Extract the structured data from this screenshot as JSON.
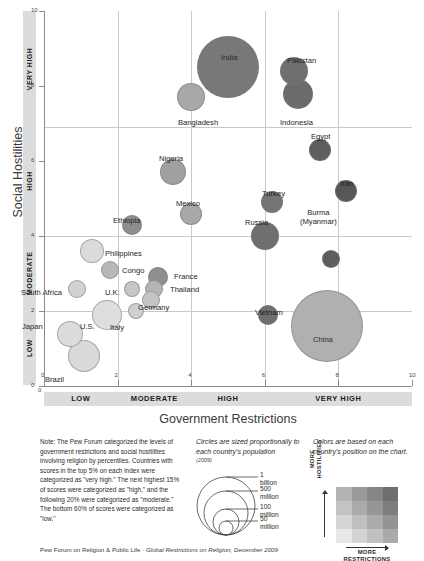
{
  "chart_data": {
    "type": "scatter",
    "title": "",
    "xlabel": "Government Restrictions",
    "ylabel": "Social Hostilities",
    "xlim": [
      0,
      10
    ],
    "ylim": [
      0,
      10
    ],
    "grid": true,
    "x_ticks": [
      "0",
      "2",
      "4",
      "6",
      "8",
      "10"
    ],
    "y_ticks": [
      "0",
      "2",
      "4",
      "6",
      "8",
      "10"
    ],
    "x_zones": [
      "LOW",
      "MODERATE",
      "HIGH",
      "VERY HIGH"
    ],
    "y_zones": [
      "LOW",
      "MODERATE",
      "HIGH",
      "VERY HIGH"
    ],
    "size_encoding": "population",
    "points": [
      {
        "label": "India",
        "x": 5.0,
        "y": 8.5,
        "r": 31,
        "color": "#787878",
        "lx": 221,
        "ly": 53,
        "inside": true
      },
      {
        "label": "Pakistan",
        "x": 6.8,
        "y": 8.4,
        "r": 14,
        "color": "#6f6f6f",
        "lx": 287,
        "ly": 56,
        "inside": false
      },
      {
        "label": "Indonesia",
        "x": 6.9,
        "y": 7.8,
        "r": 15,
        "color": "#6b6b6b",
        "lx": 280,
        "ly": 118,
        "inside": false
      },
      {
        "label": "Bangladesh",
        "x": 4.0,
        "y": 7.7,
        "r": 14,
        "color": "#a8a8a8",
        "lx": 178,
        "ly": 118,
        "inside": false
      },
      {
        "label": "Egypt",
        "x": 7.5,
        "y": 6.3,
        "r": 11,
        "color": "#5d5d5d",
        "lx": 311,
        "ly": 132,
        "inside": false
      },
      {
        "label": "Nigeria",
        "x": 3.5,
        "y": 5.7,
        "r": 13,
        "color": "#a0a0a0",
        "lx": 159,
        "ly": 154,
        "inside": false
      },
      {
        "label": "Iran",
        "x": 8.2,
        "y": 5.2,
        "r": 11,
        "color": "#575757",
        "lx": 340,
        "ly": 179,
        "inside": false
      },
      {
        "label": "Turkey",
        "x": 6.2,
        "y": 4.9,
        "r": 11,
        "color": "#757575",
        "lx": 262,
        "ly": 189,
        "inside": false
      },
      {
        "label": "Mexico",
        "x": 4.0,
        "y": 4.6,
        "r": 11,
        "color": "#a8a8a8",
        "lx": 176,
        "ly": 199,
        "inside": false
      },
      {
        "label": "Ethiopia",
        "x": 2.4,
        "y": 4.3,
        "r": 10,
        "color": "#8e8e8e",
        "lx": 113,
        "ly": 216,
        "inside": false
      },
      {
        "label": "Russia",
        "x": 6.0,
        "y": 4.0,
        "r": 14,
        "color": "#6f6f6f",
        "lx": 245,
        "ly": 218,
        "inside": false
      },
      {
        "label": "Burma (Myanmar)",
        "x": 7.8,
        "y": 3.4,
        "r": 9,
        "color": "#5e5e5e",
        "lx": 300,
        "ly": 208,
        "inside": false
      },
      {
        "label": "Philippines",
        "x": 1.3,
        "y": 3.6,
        "r": 12,
        "color": "#dcdcdc",
        "lx": 105,
        "ly": 249,
        "inside": false
      },
      {
        "label": "Congo",
        "x": 1.8,
        "y": 3.1,
        "r": 9,
        "color": "#b8b8b8",
        "lx": 122,
        "ly": 266,
        "inside": false
      },
      {
        "label": "France",
        "x": 3.1,
        "y": 2.9,
        "r": 10,
        "color": "#8e8e8e",
        "lx": 174,
        "ly": 272,
        "inside": false
      },
      {
        "label": "Thailand",
        "x": 3.0,
        "y": 2.6,
        "r": 9,
        "color": "#b4b4b4",
        "lx": 170,
        "ly": 285,
        "inside": false
      },
      {
        "label": "South Africa",
        "x": 0.9,
        "y": 2.6,
        "r": 9,
        "color": "#d2d2d2",
        "lx": 21,
        "ly": 288,
        "inside": false
      },
      {
        "label": "U.K.",
        "x": 2.4,
        "y": 2.6,
        "r": 8,
        "color": "#c6c6c6",
        "lx": 105,
        "ly": 288,
        "inside": false
      },
      {
        "label": "Germany",
        "x": 2.9,
        "y": 2.3,
        "r": 9,
        "color": "#c4c4c4",
        "lx": 138,
        "ly": 303,
        "inside": false
      },
      {
        "label": "Italy",
        "x": 2.5,
        "y": 2.0,
        "r": 8,
        "color": "#cfcfcf",
        "lx": 110,
        "ly": 323,
        "inside": false
      },
      {
        "label": "U.S.",
        "x": 1.7,
        "y": 1.9,
        "r": 15,
        "color": "#dedede",
        "lx": 80,
        "ly": 322,
        "inside": true
      },
      {
        "label": "Vietnam",
        "x": 6.1,
        "y": 1.9,
        "r": 10,
        "color": "#6f6f6f",
        "lx": 255,
        "ly": 308,
        "inside": false
      },
      {
        "label": "China",
        "x": 7.7,
        "y": 1.6,
        "r": 36,
        "color": "#b0b0b0",
        "lx": 313,
        "ly": 335,
        "inside": true
      },
      {
        "label": "Japan",
        "x": 0.7,
        "y": 1.4,
        "r": 13,
        "color": "#dcdcdc",
        "lx": 22,
        "ly": 322,
        "inside": false
      },
      {
        "label": "Brazil",
        "x": 1.1,
        "y": 0.8,
        "r": 16,
        "color": "#dadada",
        "lx": 45,
        "ly": 375,
        "inside": false
      }
    ]
  },
  "note": {
    "text": "Note: The Pew Forum categorized the levels of government restrictions and social hostilities involving religion by percentiles. Countries with scores in the top 5% on each index were categorized as \"very high.\" The next highest 15% of scores were categorized as \"high,\" and the following 20% were categorized as \"moderate.\" The bottom 60% of scores were categorized as \"low.\""
  },
  "size_legend": {
    "caption": "Circles are sized proportionally to each country's population",
    "year": "(2009)",
    "items": [
      "1\nbillion",
      "500\nmillion",
      "100\nmillion",
      "50\nmillion"
    ],
    "item1_a": "1",
    "item1_b": "billion",
    "item2_a": "500",
    "item2_b": "million",
    "item3_a": "100",
    "item3_b": "million",
    "item4_a": "50",
    "item4_b": "million"
  },
  "color_legend": {
    "caption": "Colors are based on each country's position on the chart.",
    "y_axis_label": "MORE HOSTILITIES",
    "y_axis_line1": "MORE",
    "y_axis_line2": "HOSTILITIES",
    "x_axis_line1": "MORE",
    "x_axis_line2": "RESTRICTIONS",
    "swatches": [
      "#b4b4b4",
      "#9a9a9a",
      "#868686",
      "#6e6e6e",
      "#c4c4c4",
      "#ababab",
      "#969696",
      "#7e7e7e",
      "#d6d6d6",
      "#c0c0c0",
      "#ababab",
      "#949494",
      "#e8e8e8",
      "#d4d4d4",
      "#c0c0c0",
      "#aaaaaa"
    ]
  },
  "footer": {
    "source": "Pew Forum on Religion & Public Life",
    "separator": " · ",
    "report": "Global Restrictions on Religion, December 2009"
  }
}
